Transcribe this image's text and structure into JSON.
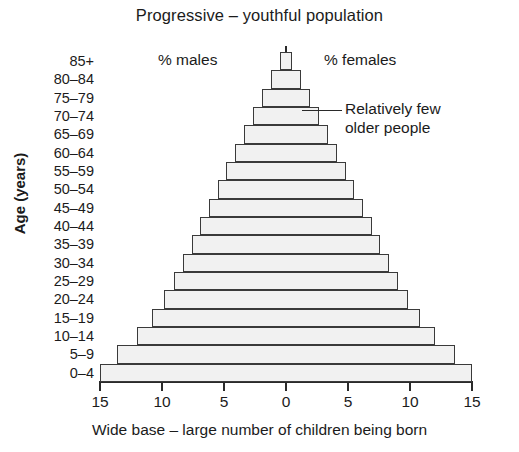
{
  "chart_data": {
    "type": "bar",
    "subtype": "population-pyramid",
    "title": "Progressive – youthful population",
    "xlabel": "Wide base – large number of children being born",
    "ylabel": "Age (years)",
    "categories": [
      "85+",
      "80–84",
      "75–79",
      "70–74",
      "65–69",
      "60–64",
      "55–59",
      "50–54",
      "45–49",
      "40–44",
      "35–39",
      "30–34",
      "25–29",
      "20–24",
      "15–19",
      "10–14",
      "5–9",
      "0–4"
    ],
    "xtick_labels": [
      "15",
      "10",
      "5",
      "0",
      "5",
      "10",
      "15"
    ],
    "xtick_values": [
      -15,
      -10,
      -5,
      0,
      5,
      10,
      15
    ],
    "xlim": [
      -15,
      15
    ],
    "grid": false,
    "series": [
      {
        "name": "% males",
        "side": "left",
        "values": [
          0.5,
          1.2,
          1.9,
          2.7,
          3.4,
          4.1,
          4.8,
          5.5,
          6.2,
          6.9,
          7.6,
          8.3,
          9.0,
          9.8,
          10.8,
          12.0,
          13.6,
          15.0
        ]
      },
      {
        "name": "% females",
        "side": "right",
        "values": [
          0.5,
          1.2,
          1.9,
          2.7,
          3.4,
          4.1,
          4.8,
          5.5,
          6.2,
          6.9,
          7.6,
          8.3,
          9.0,
          9.8,
          10.8,
          12.0,
          13.6,
          15.0
        ]
      }
    ],
    "annotations": [
      {
        "name": "males-label",
        "text": "% males"
      },
      {
        "name": "females-label",
        "text": "% females"
      },
      {
        "name": "older-people-note",
        "line1": "Relatively few",
        "line2": "older people",
        "points_at": "70–74"
      }
    ],
    "colors": {
      "bar_fill": "#f1f1f1",
      "bar_stroke": "#3a3a3a",
      "axis": "#2a2a2a",
      "text": "#1b1b1b",
      "background": "#ffffff"
    }
  }
}
